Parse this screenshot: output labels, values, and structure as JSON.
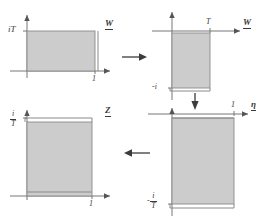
{
  "figure": {
    "type": "diagram",
    "background_color": "#ffffff",
    "rect_fill_color": "#cccccc",
    "rect_stroke_color": "#8a8a8a",
    "axis_color": "#777777",
    "text_color": "#3a3a3a",
    "arrow_color": "#3b3b3b"
  },
  "panels": [
    {
      "id": "top-left",
      "plane_label": "W",
      "vertical_axis_label": "iT",
      "vertical_axis_label_parts": {
        "sign": "",
        "numerator": "i",
        "denominator": "T",
        "is_fraction": false,
        "text": "iT"
      },
      "horizontal_tick_label": "1",
      "rect": {
        "x_from": 0,
        "x_to": 1,
        "y_from": 0,
        "y_to": "iT"
      },
      "orientation": "landscape"
    },
    {
      "id": "top-right",
      "plane_label": "W",
      "horizontal_tick_label": "T",
      "vertical_tick_label": "-i",
      "vertical_tick_label_parts": {
        "sign": "-",
        "numerator": "i",
        "denominator": "",
        "is_fraction": false,
        "text": "-i"
      },
      "rect": {
        "x_from": 0,
        "x_to": "T",
        "y_from": 0,
        "y_to": "-i"
      },
      "orientation": "portrait"
    },
    {
      "id": "bottom-left",
      "plane_label": "Z",
      "vertical_axis_label": "i/T",
      "vertical_axis_label_parts": {
        "sign": "",
        "numerator": "i",
        "denominator": "T",
        "is_fraction": true,
        "text": "i/T"
      },
      "horizontal_tick_label": "1",
      "rect": {
        "x_from": 0,
        "x_to": 1,
        "y_from": 0,
        "y_to": "i/T"
      },
      "orientation": "portrait"
    },
    {
      "id": "bottom-right",
      "plane_label": "η",
      "horizontal_tick_label": "1",
      "vertical_tick_label": "-i/T",
      "vertical_tick_label_parts": {
        "sign": "-",
        "numerator": "i",
        "denominator": "T",
        "is_fraction": true,
        "text": "-i/T"
      },
      "rect": {
        "x_from": 0,
        "x_to": 1,
        "y_from": 0,
        "y_to": "-i/T"
      },
      "orientation": "portrait"
    }
  ],
  "flow_arrows": [
    {
      "id": "arrow-top",
      "direction": "right",
      "from_panel": "top-left",
      "to_panel": "top-right"
    },
    {
      "id": "arrow-right",
      "direction": "down",
      "from_panel": "top-right",
      "to_panel": "bottom-right"
    },
    {
      "id": "arrow-bottom",
      "direction": "left",
      "from_panel": "bottom-right",
      "to_panel": "bottom-left"
    }
  ]
}
